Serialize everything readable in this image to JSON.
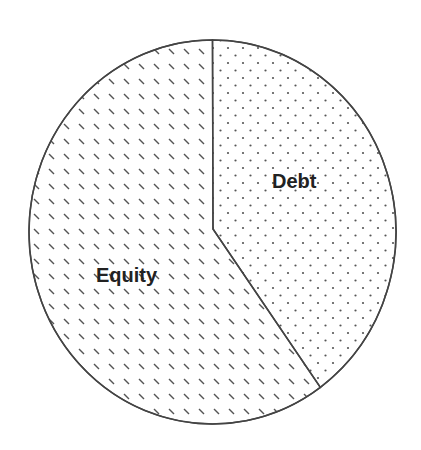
{
  "chart_data": {
    "type": "pie",
    "title": "",
    "categories": [
      "Debt",
      "Equity"
    ],
    "values": [
      40,
      60
    ],
    "units": "percent",
    "start_angle_deg": 0,
    "direction": "clockwise",
    "legend": "none (inline slice labels)",
    "slices": [
      {
        "label": "Debt",
        "value": 40,
        "pattern": "dots"
      },
      {
        "label": "Equity",
        "value": 60,
        "pattern": "diagonal-dashes"
      }
    ]
  },
  "labels": {
    "debt": "Debt",
    "equity": "Equity"
  },
  "colors": {
    "outline": "#444444",
    "pattern_ink": "#555555",
    "label_text": "#222222",
    "background": "#ffffff"
  }
}
